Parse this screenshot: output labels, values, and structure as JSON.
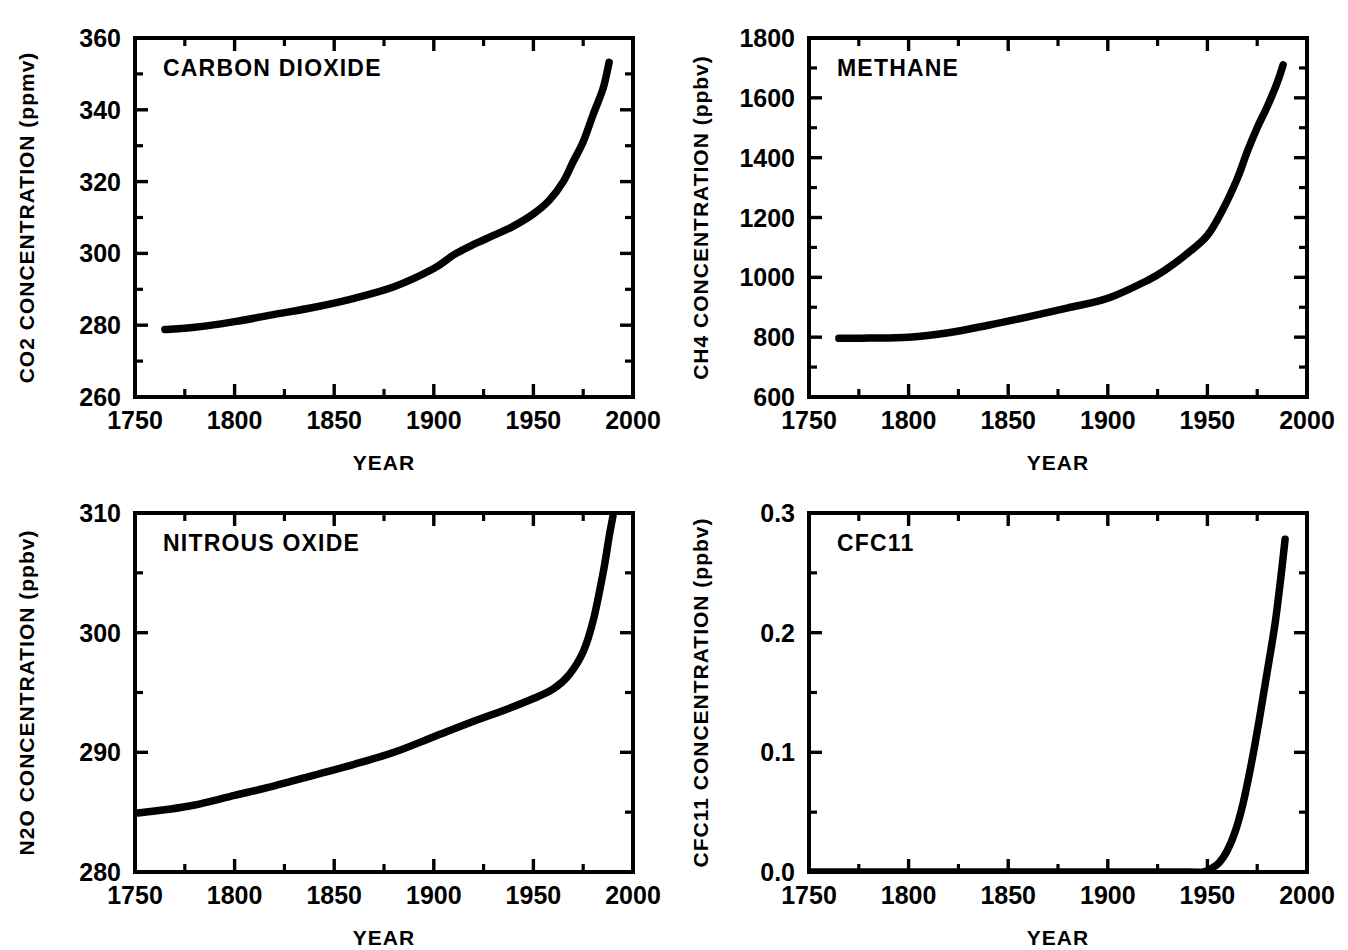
{
  "figure": {
    "background": "#ffffff",
    "ink_color": "#000000",
    "panel_count": 4
  },
  "chart_data": [
    {
      "id": "co2",
      "type": "line",
      "title": "CARBON DIOXIDE",
      "xlabel": "YEAR",
      "ylabel": "CO2 CONCENTRATION (ppmv)",
      "species": "CO2",
      "units": "ppmv",
      "xlim": [
        1750,
        2000
      ],
      "ylim": [
        260,
        360
      ],
      "xticks": [
        1750,
        1775,
        1800,
        1825,
        1850,
        1875,
        1900,
        1925,
        1950,
        1975,
        2000
      ],
      "xtick_labels": [
        "1750",
        "",
        "1800",
        "",
        "1850",
        "",
        "1900",
        "",
        "1950",
        "",
        "2000"
      ],
      "yticks": [
        260,
        270,
        280,
        290,
        300,
        310,
        320,
        330,
        340,
        350,
        360
      ],
      "ytick_labels": [
        "260",
        "",
        "280",
        "",
        "300",
        "",
        "320",
        "",
        "340",
        "",
        "360"
      ],
      "grid": false,
      "legend": null,
      "x": [
        1765,
        1780,
        1800,
        1820,
        1840,
        1860,
        1880,
        1900,
        1910,
        1920,
        1930,
        1940,
        1950,
        1958,
        1965,
        1970,
        1975,
        1980,
        1985,
        1988
      ],
      "values": [
        278.8,
        279.4,
        281.0,
        283.0,
        285.0,
        287.5,
        290.7,
        295.8,
        299.6,
        302.5,
        305.0,
        307.6,
        311.0,
        314.8,
        320.0,
        325.6,
        331.1,
        338.7,
        346.0,
        353.2
      ]
    },
    {
      "id": "ch4",
      "type": "line",
      "title": "METHANE",
      "xlabel": "YEAR",
      "ylabel": "CH4 CONCENTRATION (ppbv)",
      "species": "CH4",
      "units": "ppbv",
      "xlim": [
        1750,
        2000
      ],
      "ylim": [
        600,
        1800
      ],
      "xticks": [
        1750,
        1775,
        1800,
        1825,
        1850,
        1875,
        1900,
        1925,
        1950,
        1975,
        2000
      ],
      "xtick_labels": [
        "1750",
        "",
        "1800",
        "",
        "1850",
        "",
        "1900",
        "",
        "1950",
        "",
        "2000"
      ],
      "yticks": [
        600,
        700,
        800,
        900,
        1000,
        1100,
        1200,
        1300,
        1400,
        1500,
        1600,
        1700,
        1800
      ],
      "ytick_labels": [
        "600",
        "",
        "800",
        "",
        "1000",
        "",
        "1200",
        "",
        "1400",
        "",
        "1600",
        "",
        "1800"
      ],
      "grid": false,
      "legend": null,
      "x": [
        1765,
        1780,
        1800,
        1820,
        1840,
        1860,
        1880,
        1900,
        1920,
        1930,
        1940,
        1950,
        1958,
        1965,
        1970,
        1975,
        1980,
        1985,
        1988
      ],
      "values": [
        796,
        797,
        800,
        815,
        840,
        868,
        898,
        930,
        990,
        1030,
        1080,
        1140,
        1230,
        1330,
        1420,
        1500,
        1570,
        1650,
        1710
      ]
    },
    {
      "id": "n2o",
      "type": "line",
      "title": "NITROUS OXIDE",
      "xlabel": "YEAR",
      "ylabel": "N2O CONCENTRATION (ppbv)",
      "species": "N2O",
      "units": "ppbv",
      "xlim": [
        1750,
        2000
      ],
      "ylim": [
        280,
        310
      ],
      "xticks": [
        1750,
        1775,
        1800,
        1825,
        1850,
        1875,
        1900,
        1925,
        1950,
        1975,
        2000
      ],
      "xtick_labels": [
        "1750",
        "",
        "1800",
        "",
        "1850",
        "",
        "1900",
        "",
        "1950",
        "",
        "2000"
      ],
      "yticks": [
        280,
        285,
        290,
        295,
        300,
        305,
        310
      ],
      "ytick_labels": [
        "280",
        "",
        "290",
        "",
        "300",
        "",
        "310"
      ],
      "grid": false,
      "legend": null,
      "x": [
        1750,
        1765,
        1780,
        1800,
        1820,
        1840,
        1860,
        1880,
        1900,
        1920,
        1935,
        1950,
        1960,
        1968,
        1975,
        1980,
        1985,
        1988,
        1990
      ],
      "values": [
        284.9,
        285.2,
        285.6,
        286.4,
        287.2,
        288.1,
        289.0,
        290.0,
        291.3,
        292.6,
        293.5,
        294.5,
        295.3,
        296.5,
        298.4,
        301.0,
        305.0,
        308.0,
        309.8
      ]
    },
    {
      "id": "cfc11",
      "type": "line",
      "title": "CFC11",
      "xlabel": "YEAR",
      "ylabel": "CFC11 CONCENTRATION (ppbv)",
      "species": "CFC11",
      "units": "ppbv",
      "xlim": [
        1750,
        2000
      ],
      "ylim": [
        0.0,
        0.3
      ],
      "xticks": [
        1750,
        1775,
        1800,
        1825,
        1850,
        1875,
        1900,
        1925,
        1950,
        1975,
        2000
      ],
      "xtick_labels": [
        "1750",
        "",
        "1800",
        "",
        "1850",
        "",
        "1900",
        "",
        "1950",
        "",
        "2000"
      ],
      "yticks": [
        0.0,
        0.05,
        0.1,
        0.15,
        0.2,
        0.25,
        0.3
      ],
      "ytick_labels": [
        "0.0",
        "",
        "0.1",
        "",
        "0.2",
        "",
        "0.3"
      ],
      "grid": false,
      "legend": null,
      "x": [
        1750,
        1900,
        1940,
        1948,
        1952,
        1956,
        1960,
        1964,
        1968,
        1972,
        1976,
        1980,
        1984,
        1987,
        1989
      ],
      "values": [
        0.0,
        0.0,
        0.0,
        0.0,
        0.003,
        0.008,
        0.018,
        0.034,
        0.058,
        0.09,
        0.127,
        0.167,
        0.208,
        0.248,
        0.278
      ]
    }
  ]
}
